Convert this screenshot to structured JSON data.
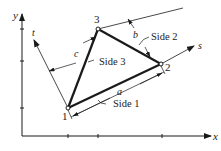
{
  "diagram": {
    "axes": {
      "x_label": "x",
      "y_label": "y"
    },
    "local_axes": {
      "s_label": "s",
      "t_label": "t"
    },
    "nodes": [
      {
        "id": "1",
        "label": "1"
      },
      {
        "id": "2",
        "label": "2"
      },
      {
        "id": "3",
        "label": "3"
      }
    ],
    "sides": [
      {
        "label": "Side 1"
      },
      {
        "label": "Side 2"
      },
      {
        "label": "Side 3"
      }
    ],
    "dimensions": {
      "a": "a",
      "b": "b",
      "c": "c"
    },
    "colors": {
      "ink": "#1a1a1a"
    }
  }
}
